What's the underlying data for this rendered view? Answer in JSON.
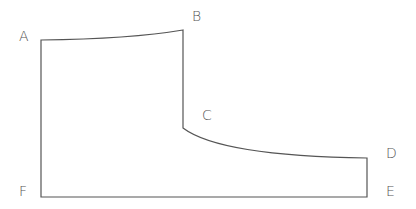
{
  "diagram": {
    "type": "outline-shape",
    "labels": {
      "A": "A",
      "B": "B",
      "C": "C",
      "D": "D",
      "E": "E",
      "F": "F"
    },
    "points": {
      "A": [
        41,
        40
      ],
      "B": [
        183,
        30
      ],
      "C": [
        183,
        128
      ],
      "D": [
        367,
        158
      ],
      "E": [
        367,
        197
      ],
      "F": [
        41,
        197
      ]
    },
    "colors": {
      "stroke": "#555555",
      "background": "#ffffff"
    }
  }
}
